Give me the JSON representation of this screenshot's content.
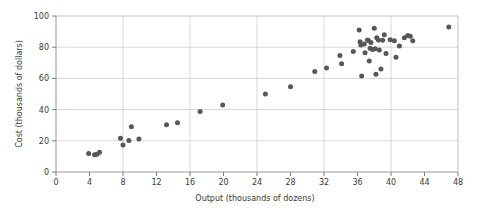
{
  "chart_data": {
    "type": "scatter",
    "title": "",
    "xlabel": "Output (thousands of dozens)",
    "ylabel": "Cost (thousands of dollars)",
    "xlim": [
      0,
      48
    ],
    "ylim": [
      0,
      100
    ],
    "xticks": [
      0,
      4,
      8,
      12,
      16,
      20,
      24,
      28,
      32,
      36,
      40,
      44,
      48
    ],
    "yticks": [
      0,
      20,
      40,
      60,
      80,
      100
    ],
    "xtick_labels": [
      "0",
      "4",
      "8",
      "12",
      "16",
      "20",
      "24",
      "28",
      "32",
      "36",
      "40",
      "44",
      "48"
    ],
    "ytick_labels": [
      "0",
      "20",
      "40",
      "60",
      "80",
      "100"
    ],
    "x_gridlines": [
      8,
      16,
      24,
      32,
      40,
      48
    ],
    "y_gridlines": [
      20,
      40,
      60,
      80,
      100
    ],
    "grid": true,
    "legend": false,
    "marker": "filled-circle",
    "marker_color": "#56565c",
    "marker_size_px": 5,
    "point_count": 48,
    "points": [
      [
        3.9,
        11.9
      ],
      [
        4.6,
        11.0
      ],
      [
        4.9,
        11.3
      ],
      [
        5.2,
        12.7
      ],
      [
        7.7,
        21.6
      ],
      [
        8.0,
        17.3
      ],
      [
        8.7,
        20.2
      ],
      [
        9.0,
        29.0
      ],
      [
        9.9,
        21.1
      ],
      [
        13.2,
        30.3
      ],
      [
        14.5,
        31.5
      ],
      [
        17.2,
        38.8
      ],
      [
        19.9,
        42.9
      ],
      [
        25.0,
        50.0
      ],
      [
        28.0,
        54.6
      ],
      [
        30.9,
        64.4
      ],
      [
        32.3,
        66.6
      ],
      [
        33.9,
        74.6
      ],
      [
        34.1,
        69.4
      ],
      [
        35.5,
        77.2
      ],
      [
        36.2,
        91.0
      ],
      [
        36.3,
        83.5
      ],
      [
        36.4,
        81.4
      ],
      [
        36.5,
        61.6
      ],
      [
        36.8,
        82.1
      ],
      [
        36.9,
        76.5
      ],
      [
        37.2,
        84.6
      ],
      [
        37.3,
        84.3
      ],
      [
        37.4,
        71.2
      ],
      [
        37.5,
        79.4
      ],
      [
        37.6,
        83.0
      ],
      [
        37.8,
        78.6
      ],
      [
        38.0,
        92.2
      ],
      [
        38.1,
        79.0
      ],
      [
        38.2,
        62.6
      ],
      [
        38.3,
        86.0
      ],
      [
        38.5,
        84.6
      ],
      [
        38.6,
        78.2
      ],
      [
        38.8,
        66.0
      ],
      [
        39.0,
        84.5
      ],
      [
        39.2,
        88.0
      ],
      [
        39.4,
        76.0
      ],
      [
        39.9,
        84.8
      ],
      [
        40.4,
        84.2
      ],
      [
        40.6,
        73.6
      ],
      [
        41.0,
        80.8
      ],
      [
        41.6,
        86.0
      ],
      [
        42.0,
        87.5
      ],
      [
        42.3,
        87.0
      ],
      [
        42.6,
        84.2
      ],
      [
        46.9,
        92.9
      ]
    ]
  },
  "labels": {
    "x_axis_title": "Output (thousands of dozens)",
    "y_axis_title": "Cost (thousands of dollars)"
  }
}
